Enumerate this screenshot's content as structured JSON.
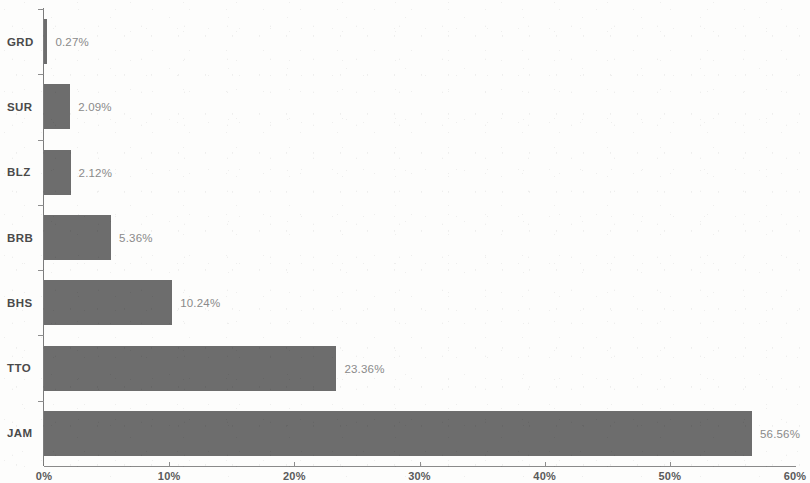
{
  "chart_data": {
    "type": "bar",
    "orientation": "horizontal",
    "title": "",
    "subtitle": "",
    "xlabel": "",
    "ylabel": "",
    "xlim": [
      0,
      60
    ],
    "grid": false,
    "legend": null,
    "bar_color": "#6d6d6d",
    "axis_color": "#8a8a8a",
    "label_color": "#8a8a8a",
    "category_color": "#4a4a4a",
    "background_color": "#fdfdfc",
    "x_ticks": [
      "0%",
      "10%",
      "20%",
      "30%",
      "40%",
      "50%",
      "60%"
    ],
    "x_tick_values": [
      0,
      10,
      20,
      30,
      40,
      50,
      60
    ],
    "categories": [
      "GRD",
      "SUR",
      "BLZ",
      "BRB",
      "BHS",
      "TTO",
      "JAM"
    ],
    "values": [
      0.27,
      2.09,
      2.12,
      5.36,
      10.24,
      23.36,
      56.56
    ],
    "value_labels": [
      "0.27%",
      "2.09%",
      "2.12%",
      "5.36%",
      "10.24%",
      "23.36%",
      "56.56%"
    ],
    "bars": [
      {
        "category": "GRD",
        "value": 0.27,
        "label": "0.27%"
      },
      {
        "category": "SUR",
        "value": 2.09,
        "label": "2.09%"
      },
      {
        "category": "BLZ",
        "value": 2.12,
        "label": "2.12%"
      },
      {
        "category": "BRB",
        "value": 5.36,
        "label": "5.36%"
      },
      {
        "category": "BHS",
        "value": 10.24,
        "label": "10.24%"
      },
      {
        "category": "TTO",
        "value": 23.36,
        "label": "23.36%"
      },
      {
        "category": "JAM",
        "value": 56.56,
        "label": "56.56%"
      }
    ]
  }
}
